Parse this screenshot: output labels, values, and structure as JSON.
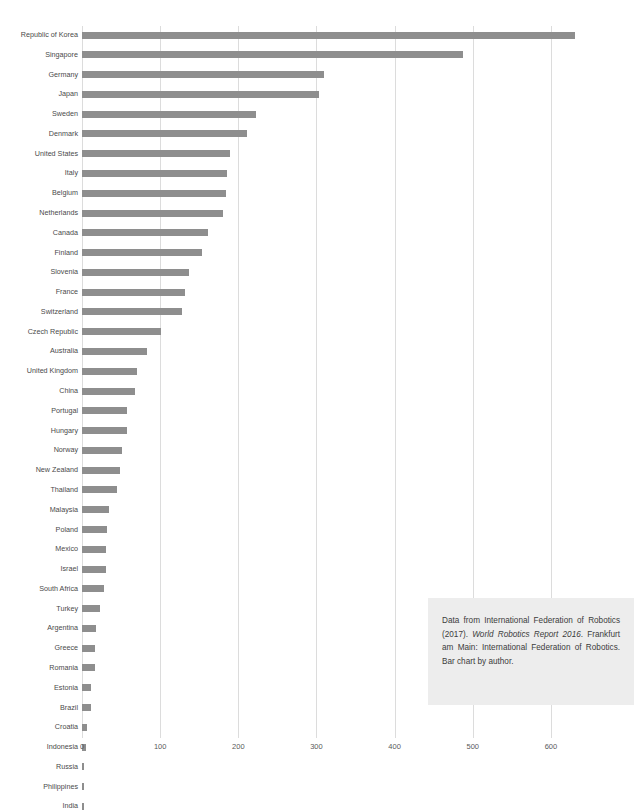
{
  "chart_data": {
    "type": "bar",
    "orientation": "horizontal",
    "title": "",
    "xlabel": "",
    "ylabel": "",
    "xlim": [
      0,
      640
    ],
    "xticks": [
      0,
      100,
      200,
      300,
      400,
      500,
      600
    ],
    "xtick_labels": [
      "0",
      "100",
      "200",
      "300",
      "400",
      "500",
      "600"
    ],
    "grid": true,
    "grid_axis": "x",
    "legend": null,
    "bar_color": "#8e8e8e",
    "categories": [
      "Republic of Korea",
      "Singapore",
      "Germany",
      "Japan",
      "Sweden",
      "Denmark",
      "United States",
      "Italy",
      "Belgium",
      "Netherlands",
      "Canada",
      "Finland",
      "Slovenia",
      "France",
      "Switzerland",
      "Czech Republic",
      "Australia",
      "United Kingdom",
      "China",
      "Portugal",
      "Hungary",
      "Norway",
      "New Zealand",
      "Thailand",
      "Malaysia",
      "Poland",
      "Mexico",
      "Israel",
      "South Africa",
      "Turkey",
      "Argentina",
      "Greece",
      "Romania",
      "Estonia",
      "Brazil",
      "Croatia",
      "Indonesia",
      "Russia",
      "Philippines",
      "India"
    ],
    "values": [
      631,
      488,
      309,
      303,
      223,
      211,
      189,
      185,
      184,
      180,
      161,
      153,
      137,
      132,
      128,
      101,
      83,
      71,
      68,
      58,
      57,
      51,
      49,
      45,
      34,
      32,
      31,
      31,
      28,
      23,
      18,
      17,
      16,
      12,
      11,
      6,
      5,
      3,
      3,
      3
    ]
  },
  "caption": {
    "part1": "Data from International Federation of Robotics (2017). ",
    "italic": "World Robotics Report 2016",
    "part2": ". Frankfurt am Main: International Federation of Robotics. Bar chart by author."
  }
}
